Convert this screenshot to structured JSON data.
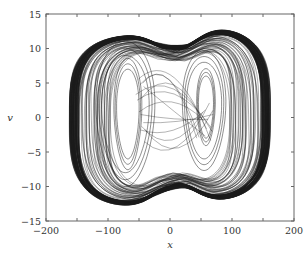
{
  "chart_data": {
    "type": "line",
    "title": "",
    "xlabel": "x",
    "ylabel": "v",
    "xlim": [
      -200,
      200
    ],
    "ylim": [
      -15,
      15
    ],
    "xticks": [
      -200,
      -100,
      0,
      100,
      200
    ],
    "xtick_labels": [
      "−200",
      "−100",
      "0",
      "100",
      "200"
    ],
    "xminor_ticks": [
      -150,
      -50,
      50,
      150
    ],
    "yticks": [
      -15,
      -10,
      -5,
      0,
      5,
      10,
      15
    ],
    "ytick_labels": [
      "−15",
      "−10",
      "−5",
      "0",
      "5",
      "10",
      "15"
    ],
    "grid": false,
    "legend": null,
    "outer_envelope": {
      "x_range": [
        -160,
        162
      ],
      "v_range": [
        -13.6,
        13.4
      ],
      "top_left_max": [
        -85,
        12.4
      ],
      "top_dip": [
        10,
        9.5
      ],
      "top_right_max": [
        95,
        13.4
      ],
      "bottom_left_min": [
        -75,
        -13.6
      ],
      "bottom_rise": [
        10,
        -10.5
      ],
      "bottom_right_min": [
        80,
        -13.0
      ]
    },
    "inner_loops": [
      {
        "center": [
          -68,
          0.5
        ],
        "x_halfwidth": 18,
        "v_halfheight": 6.5
      },
      {
        "center": [
          -72,
          0.5
        ],
        "x_halfwidth": 38,
        "v_halfheight": 8.5
      },
      {
        "center": [
          58,
          1.5
        ],
        "x_halfwidth": 12,
        "v_halfheight": 4.5
      },
      {
        "center": [
          55,
          1.0
        ],
        "x_halfwidth": 28,
        "v_halfheight": 7.0
      }
    ]
  },
  "colors": {
    "line": "#1a1a1a",
    "axis": "#555555",
    "background": "#ffffff"
  }
}
